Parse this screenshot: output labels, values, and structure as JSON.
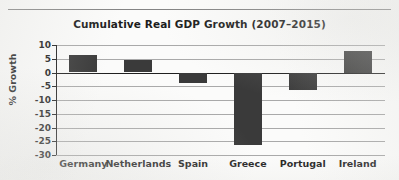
{
  "chart_data": {
    "type": "bar",
    "title": "Cumulative Real GDP Growth (2007–2015)",
    "xlabel": "",
    "ylabel": "% Growth",
    "categories": [
      "Germany",
      "Netherlands",
      "Spain",
      "Greece",
      "Portugal",
      "Ireland"
    ],
    "values": [
      6.2,
      4.6,
      -3.8,
      -26.5,
      -6.5,
      8.0
    ],
    "ylim": [
      -30,
      10
    ],
    "yticks": [
      10,
      5,
      0,
      -5,
      -10,
      -15,
      -20,
      -25,
      -30
    ],
    "ytick_labels": [
      "10",
      "5",
      "0",
      "-5",
      "-10",
      "-15",
      "-20",
      "-25",
      "-30"
    ],
    "grid": true,
    "legend": false,
    "bar_color": "#3a3a3a",
    "gridline_color": "#a9a9a9",
    "axis_color": "#1f1f1f",
    "background_color": "#fbfbfa"
  }
}
